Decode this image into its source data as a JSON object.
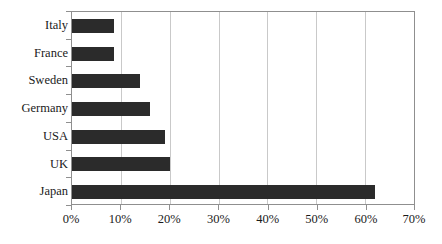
{
  "chart_data": {
    "type": "bar",
    "orientation": "horizontal",
    "title": "",
    "subtitle": "",
    "xlabel": "",
    "ylabel": "",
    "categories": [
      "Japan",
      "UK",
      "USA",
      "Germany",
      "Sweden",
      "France",
      "Italy"
    ],
    "values": [
      62,
      20,
      19,
      16,
      14,
      8.5,
      8.5
    ],
    "series": [
      {
        "name": "",
        "values": [
          62,
          20,
          19,
          16,
          14,
          8.5,
          8.5
        ]
      }
    ],
    "xlim": [
      0,
      70
    ],
    "ylim": null,
    "xticks": [
      0,
      10,
      20,
      30,
      40,
      50,
      60,
      70
    ],
    "xticklabels": [
      "0%",
      "10%",
      "20%",
      "30%",
      "40%",
      "50%",
      "60%",
      "70%"
    ],
    "grid": "vertical",
    "legend": false,
    "legend_position": "none",
    "annotations": [],
    "colors": {
      "bar": "#2b2b2b",
      "gridline": "#c9c9c9",
      "frame": "#8f8f8f",
      "text": "#1a1a1a",
      "background": "#ffffff"
    }
  },
  "axis": {
    "category_labels": [
      "Italy",
      "France",
      "Sweden",
      "Germany",
      "USA",
      "UK",
      "Japan"
    ],
    "tick_labels": [
      "0%",
      "10%",
      "20%",
      "30%",
      "40%",
      "50%",
      "60%",
      "70%"
    ]
  }
}
